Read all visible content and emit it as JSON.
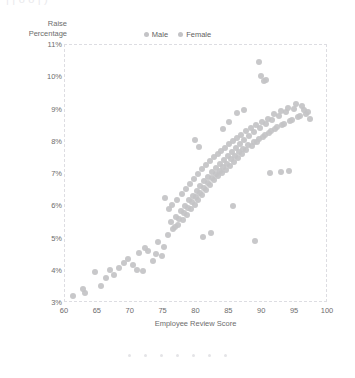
{
  "top_clip_text": "|   |                                                    o         o      |              )",
  "legend": {
    "position": "top-center",
    "items": [
      {
        "label": "Male",
        "color": "#c3c3c6",
        "marker": "circle-marker"
      },
      {
        "label": "Female",
        "color": "#c3c3c6",
        "marker": "circle-marker"
      }
    ]
  },
  "pager": {
    "count": 7,
    "active_index": 0,
    "dot_color": "#e4e4e7"
  },
  "chart_data": {
    "type": "scatter",
    "title": "",
    "xlabel": "Employee Review Score",
    "ylabel": "Raise Percentage",
    "ylabel_lines": "Raise\nPercentage",
    "xlim": [
      60,
      100
    ],
    "ylim": [
      3,
      11
    ],
    "xticks": [
      60,
      65,
      70,
      75,
      80,
      85,
      90,
      95,
      100
    ],
    "xtick_labels": [
      "60",
      "65",
      "70",
      "75",
      "80",
      "85",
      "90",
      "95",
      "100"
    ],
    "yticks": [
      3,
      4,
      5,
      6,
      7,
      8,
      9,
      10,
      11
    ],
    "ytick_labels": [
      "3%",
      "4%",
      "5%",
      "6%",
      "7%",
      "8%",
      "9%",
      "10%",
      "11%"
    ],
    "grid": false,
    "frame": "dashed-light",
    "marker_color": "#c3c3c6",
    "marker_size_px": 6,
    "series": [
      {
        "name": "Male",
        "color": "#c3c3c6",
        "points": [
          [
            61.2,
            3.22
          ],
          [
            63.1,
            3.3
          ],
          [
            64.6,
            3.95
          ],
          [
            65.4,
            3.52
          ],
          [
            66.8,
            4.02
          ],
          [
            67.5,
            3.88
          ],
          [
            68.2,
            4.1
          ],
          [
            69.6,
            4.35
          ],
          [
            70.4,
            4.18
          ],
          [
            71.2,
            4.55
          ],
          [
            71.9,
            3.98
          ],
          [
            72.6,
            4.62
          ],
          [
            73.4,
            4.3
          ],
          [
            74.1,
            4.88
          ],
          [
            74.8,
            4.46
          ],
          [
            75.2,
            6.25
          ],
          [
            75.6,
            5.1
          ],
          [
            76.1,
            5.52
          ],
          [
            76.5,
            5.28
          ],
          [
            76.9,
            5.68
          ],
          [
            77.2,
            5.42
          ],
          [
            77.6,
            5.85
          ],
          [
            77.9,
            5.58
          ],
          [
            78.2,
            6.02
          ],
          [
            78.5,
            5.72
          ],
          [
            78.8,
            6.18
          ],
          [
            79.1,
            5.9
          ],
          [
            79.4,
            6.32
          ],
          [
            79.7,
            6.05
          ],
          [
            80.0,
            6.48
          ],
          [
            80.3,
            6.2
          ],
          [
            80.6,
            6.62
          ],
          [
            80.9,
            6.35
          ],
          [
            81.2,
            6.78
          ],
          [
            81.5,
            6.5
          ],
          [
            81.8,
            6.92
          ],
          [
            82.1,
            6.65
          ],
          [
            82.4,
            7.05
          ],
          [
            82.7,
            6.8
          ],
          [
            83.0,
            7.18
          ],
          [
            83.3,
            6.95
          ],
          [
            83.6,
            7.3
          ],
          [
            83.9,
            7.02
          ],
          [
            84.2,
            7.42
          ],
          [
            84.5,
            7.12
          ],
          [
            84.8,
            7.55
          ],
          [
            85.1,
            7.25
          ],
          [
            85.4,
            7.68
          ],
          [
            85.7,
            7.38
          ],
          [
            86.0,
            7.8
          ],
          [
            86.3,
            7.5
          ],
          [
            86.6,
            7.92
          ],
          [
            86.9,
            7.62
          ],
          [
            87.2,
            8.05
          ],
          [
            87.6,
            7.75
          ],
          [
            88.0,
            8.18
          ],
          [
            88.4,
            7.88
          ],
          [
            88.8,
            8.3
          ],
          [
            89.2,
            8.0
          ],
          [
            89.6,
            8.42
          ],
          [
            90.1,
            8.15
          ],
          [
            90.6,
            8.55
          ],
          [
            91.0,
            8.28
          ],
          [
            91.5,
            8.68
          ],
          [
            92.0,
            8.4
          ],
          [
            92.5,
            8.8
          ],
          [
            93.0,
            8.52
          ],
          [
            93.6,
            8.92
          ],
          [
            94.2,
            8.64
          ],
          [
            94.8,
            9.02
          ],
          [
            95.4,
            8.76
          ],
          [
            96.0,
            9.12
          ],
          [
            96.6,
            8.85
          ],
          [
            97.2,
            8.7
          ],
          [
            89.5,
            10.48
          ],
          [
            89.8,
            10.05
          ],
          [
            90.2,
            9.88
          ],
          [
            90.5,
            9.92
          ],
          [
            88.9,
            4.92
          ]
        ]
      },
      {
        "name": "Female",
        "color": "#c3c3c6",
        "points": [
          [
            62.8,
            3.42
          ],
          [
            66.2,
            3.78
          ],
          [
            68.9,
            4.25
          ],
          [
            70.9,
            4.02
          ],
          [
            72.1,
            4.72
          ],
          [
            73.8,
            4.52
          ],
          [
            75.0,
            4.75
          ],
          [
            75.8,
            5.9
          ],
          [
            76.3,
            6.05
          ],
          [
            76.7,
            5.35
          ],
          [
            77.0,
            6.2
          ],
          [
            77.4,
            5.62
          ],
          [
            77.8,
            6.38
          ],
          [
            78.1,
            5.8
          ],
          [
            78.4,
            6.55
          ],
          [
            78.7,
            5.95
          ],
          [
            79.0,
            6.7
          ],
          [
            79.3,
            6.12
          ],
          [
            79.6,
            6.85
          ],
          [
            79.9,
            6.28
          ],
          [
            80.2,
            7.0
          ],
          [
            80.5,
            6.42
          ],
          [
            80.8,
            7.15
          ],
          [
            81.1,
            6.58
          ],
          [
            81.4,
            7.28
          ],
          [
            81.7,
            6.72
          ],
          [
            82.0,
            7.4
          ],
          [
            82.3,
            6.88
          ],
          [
            82.6,
            7.52
          ],
          [
            82.9,
            7.0
          ],
          [
            83.2,
            7.62
          ],
          [
            83.5,
            7.1
          ],
          [
            83.8,
            7.72
          ],
          [
            84.1,
            7.22
          ],
          [
            84.4,
            7.82
          ],
          [
            84.7,
            7.32
          ],
          [
            85.0,
            7.92
          ],
          [
            85.3,
            7.45
          ],
          [
            85.6,
            8.02
          ],
          [
            85.9,
            7.55
          ],
          [
            86.2,
            8.12
          ],
          [
            86.5,
            7.68
          ],
          [
            86.8,
            8.22
          ],
          [
            87.1,
            7.78
          ],
          [
            87.5,
            8.32
          ],
          [
            87.9,
            7.9
          ],
          [
            88.3,
            8.42
          ],
          [
            88.7,
            8.0
          ],
          [
            89.1,
            8.52
          ],
          [
            89.5,
            8.1
          ],
          [
            90.0,
            8.62
          ],
          [
            90.4,
            8.22
          ],
          [
            90.8,
            8.72
          ],
          [
            91.3,
            8.32
          ],
          [
            91.8,
            8.85
          ],
          [
            92.3,
            8.45
          ],
          [
            92.8,
            8.95
          ],
          [
            93.3,
            8.55
          ],
          [
            93.9,
            9.05
          ],
          [
            94.5,
            8.68
          ],
          [
            95.1,
            9.18
          ],
          [
            95.7,
            8.8
          ],
          [
            96.3,
            9.0
          ],
          [
            96.9,
            8.92
          ],
          [
            79.8,
            8.05
          ],
          [
            80.4,
            7.85
          ],
          [
            84.0,
            8.4
          ],
          [
            84.9,
            8.62
          ],
          [
            86.1,
            8.9
          ],
          [
            87.3,
            9.0
          ],
          [
            81.0,
            5.05
          ],
          [
            82.2,
            5.18
          ],
          [
            85.5,
            6.0
          ],
          [
            91.2,
            7.02
          ],
          [
            92.9,
            7.05
          ],
          [
            94.0,
            7.1
          ]
        ]
      }
    ]
  }
}
